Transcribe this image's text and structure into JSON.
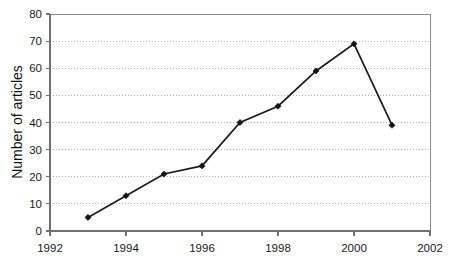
{
  "chart_data": {
    "type": "line",
    "title": "",
    "subtitle": "",
    "xlabel": "",
    "ylabel": "Number of articles",
    "x": [
      1993,
      1994,
      1995,
      1996,
      1997,
      1998,
      1999,
      2000,
      2001
    ],
    "values": [
      5,
      13,
      21,
      24,
      40,
      46,
      59,
      69,
      39
    ],
    "series": [
      {
        "name": "Number of articles",
        "x": [
          1993,
          1994,
          1995,
          1996,
          1997,
          1998,
          1999,
          2000,
          2001
        ],
        "values": [
          5,
          13,
          21,
          24,
          40,
          46,
          59,
          69,
          39
        ]
      }
    ],
    "xlim": [
      1992,
      2002
    ],
    "ylim": [
      0,
      80
    ],
    "x_ticks": [
      1992,
      1994,
      1996,
      1998,
      2000,
      2002
    ],
    "x_tick_labels": [
      "1992",
      "1994",
      "1996",
      "1998",
      "2000",
      "2002"
    ],
    "y_ticks": [
      0,
      10,
      20,
      30,
      40,
      50,
      60,
      70,
      80
    ],
    "y_tick_labels": [
      "0",
      "10",
      "20",
      "30",
      "40",
      "50",
      "60",
      "70",
      "80"
    ],
    "grid": "horizontal-dotted",
    "legend": "none",
    "marker": "filled-diamond",
    "line_color": "#1c1c1c",
    "marker_color": "#141414",
    "grid_color": "#a8a8a8",
    "axis_color": "#6f6f6f",
    "background_color": "#ffffff",
    "annotations": []
  }
}
